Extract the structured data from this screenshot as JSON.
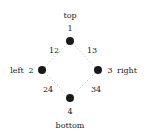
{
  "diagram": {
    "type": "graph",
    "edge_style": "dotted",
    "edge_color": "#c8c8c8",
    "node_color": "#1a1a1a",
    "nodes": [
      {
        "id": "1",
        "label": "1",
        "name": "top",
        "x": 70,
        "y": 41
      },
      {
        "id": "2",
        "label": "2",
        "name": "left",
        "x": 42,
        "y": 70
      },
      {
        "id": "3",
        "label": "3",
        "name": "right",
        "x": 98,
        "y": 70
      },
      {
        "id": "4",
        "label": "4",
        "name": "bottom",
        "x": 70,
        "y": 98
      }
    ],
    "edges": [
      {
        "from": "1",
        "to": "2",
        "label": "12"
      },
      {
        "from": "1",
        "to": "3",
        "label": "13"
      },
      {
        "from": "2",
        "to": "4",
        "label": "24"
      },
      {
        "from": "3",
        "to": "4",
        "label": "34"
      }
    ]
  },
  "labels": {
    "top_name": "top",
    "top_id": "1",
    "left_name": "left",
    "left_id": "2",
    "right_id": "3",
    "right_name": "right",
    "bottom_id": "4",
    "bottom_name": "bottom",
    "edge_12": "12",
    "edge_13": "13",
    "edge_24": "24",
    "edge_34": "34"
  }
}
